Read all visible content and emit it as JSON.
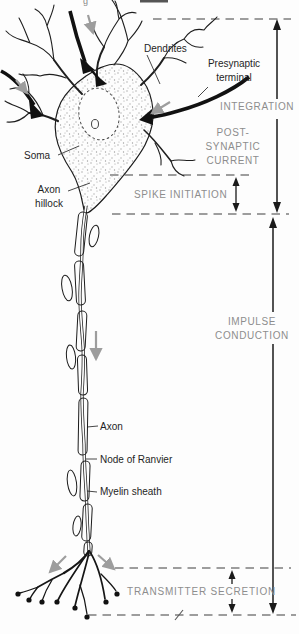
{
  "figure": {
    "type": "neuron-functional-zones-diagram",
    "part_labels": {
      "dendrites": "Dendrites",
      "presynaptic_terminal": "Presynaptic terminal",
      "soma": "Soma",
      "axon_hillock": "Axon hillock",
      "axon": "Axon",
      "node_of_ranvier": "Node of Ranvier",
      "myelin_sheath": "Myelin sheath"
    },
    "zone_labels": {
      "integration": "INTEGRATION",
      "post_synaptic_current": "POST- SYNAPTIC CURRENT",
      "spike_initiation": "SPIKE INITIATION",
      "impulse_conduction": "IMPULSE CONDUCTION",
      "transmitter_secretion": "TRANSMITTER SECRETION"
    },
    "artifacts": {
      "top_glyph": "g"
    },
    "colors": {
      "ink": "#1c1c1c",
      "gray_label": "#8d8d8d",
      "signal_arrow": "#9d9d9d",
      "boundary_dash": "#7e7e7e",
      "background": "#fdfdfd"
    }
  }
}
